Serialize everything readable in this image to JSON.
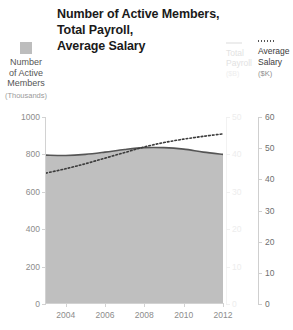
{
  "title": {
    "line1": "Number of Active Members,",
    "line2": "Total Payroll,",
    "line3": "Average Salary"
  },
  "legend": {
    "members": {
      "label_line1": "Number",
      "label_line2": "of Active",
      "label_line3": "Members",
      "unit": "(Thousands)",
      "marker": "filled-square-swatch",
      "color": "#bdbdbd"
    },
    "payroll": {
      "label_line1": "Total",
      "label_line2": "Payroll",
      "unit": "($B)",
      "marker": "solid-line-swatch",
      "color": "#ededed"
    },
    "salary": {
      "label_line1": "Average",
      "label_line2": "Salary",
      "unit": "($K)",
      "marker": "dotted-line-swatch",
      "color": "#555555"
    }
  },
  "axes": {
    "left": {
      "ticks": [
        "1000",
        "800",
        "600",
        "400",
        "200",
        "0"
      ]
    },
    "payroll": {
      "ticks": [
        "50",
        "40",
        "30",
        "20",
        "10",
        "0"
      ]
    },
    "salary": {
      "ticks": [
        "60",
        "50",
        "40",
        "30",
        "20",
        "10",
        "0"
      ]
    },
    "x": {
      "ticks": [
        "2004",
        "2006",
        "2008",
        "2010",
        "2012"
      ]
    }
  },
  "chart_data": {
    "type": "area",
    "title": "Number of Active Members, Total Payroll, Average Salary",
    "xlabel": "",
    "ylabel": "Number of Active Members (Thousands)",
    "grid": false,
    "legend_position": "top-left-and-top-right",
    "x": [
      2003,
      2004,
      2005,
      2006,
      2007,
      2008,
      2009,
      2010,
      2011,
      2012
    ],
    "xlim": [
      2003,
      2012
    ],
    "xticks": [
      2004,
      2006,
      2008,
      2010,
      2012
    ],
    "series": [
      {
        "name": "Number of Active Members",
        "unit": "Thousands",
        "axis": "left",
        "style": "filled-area",
        "color": "#bdbdbd",
        "ylim": [
          0,
          1000
        ],
        "yticks": [
          0,
          200,
          400,
          600,
          800,
          1000
        ],
        "values": [
          795,
          793,
          800,
          812,
          826,
          835,
          836,
          828,
          812,
          800
        ]
      },
      {
        "name": "Total Payroll",
        "unit": "$B",
        "axis": "right-inner",
        "style": "solid-line",
        "color": "#4d4d4d",
        "ylim": [
          0,
          50
        ],
        "yticks": [
          0,
          10,
          20,
          30,
          40,
          50
        ],
        "values": [
          39.8,
          39.7,
          40.0,
          40.6,
          41.3,
          41.8,
          41.8,
          41.4,
          40.6,
          40.0
        ]
      },
      {
        "name": "Average Salary",
        "unit": "$K",
        "axis": "right-outer",
        "style": "dotted-line",
        "color": "#3b3b3b",
        "ylim": [
          0,
          60
        ],
        "yticks": [
          0,
          10,
          20,
          30,
          40,
          50,
          60
        ],
        "values": [
          42.0,
          43.4,
          45.0,
          46.8,
          48.6,
          50.4,
          51.8,
          52.9,
          53.8,
          54.6
        ]
      }
    ]
  }
}
